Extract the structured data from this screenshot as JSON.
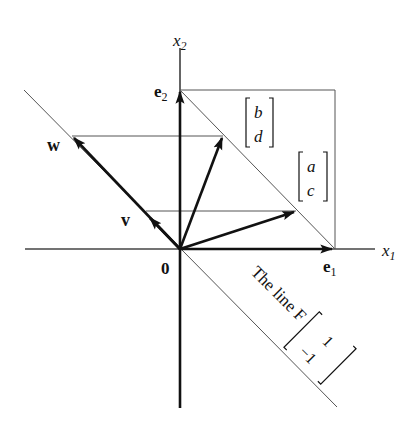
{
  "diagram": {
    "type": "linear-transformation-figure",
    "axes": {
      "x_label": "x",
      "x_sub": "1",
      "y_label": "x",
      "y_sub": "2"
    },
    "origin_label": "0",
    "basis": {
      "e1": {
        "label": "e",
        "sub": "1"
      },
      "e2": {
        "label": "e",
        "sub": "2"
      }
    },
    "vectors": {
      "w": {
        "label": "w"
      },
      "v": {
        "label": "v"
      }
    },
    "columns": {
      "bd": {
        "top": "b",
        "bottom": "d"
      },
      "ac": {
        "top": "a",
        "bottom": "c"
      }
    },
    "line_F": {
      "text": "The line F",
      "vector_top": "1",
      "vector_bottom": "−1"
    },
    "colors": {
      "ink": "#111111",
      "thin_line": "#555555",
      "background": "#ffffff"
    }
  }
}
